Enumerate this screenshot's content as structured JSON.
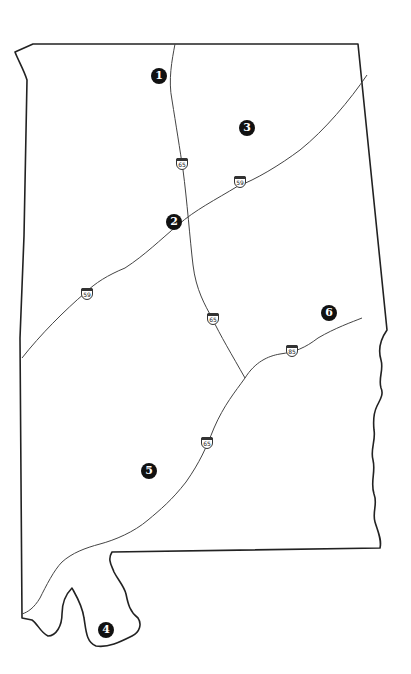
{
  "map": {
    "region": "Alabama",
    "colors": {
      "background": "#ffffff",
      "border": "#222222",
      "road": "#444444",
      "marker_fill": "#111111",
      "marker_text": "#ffffff"
    }
  },
  "markers": [
    {
      "id": "1",
      "label": "1",
      "x": 159,
      "y": 76
    },
    {
      "id": "2",
      "label": "2",
      "x": 174,
      "y": 222
    },
    {
      "id": "3",
      "label": "3",
      "x": 247,
      "y": 128
    },
    {
      "id": "4",
      "label": "4",
      "x": 106,
      "y": 630
    },
    {
      "id": "5",
      "label": "5",
      "x": 149,
      "y": 471
    },
    {
      "id": "6",
      "label": "6",
      "x": 329,
      "y": 313
    }
  ],
  "shields": [
    {
      "route": "65",
      "x": 182,
      "y": 164
    },
    {
      "route": "59",
      "x": 240,
      "y": 182
    },
    {
      "route": "59",
      "x": 87,
      "y": 294
    },
    {
      "route": "65",
      "x": 213,
      "y": 319
    },
    {
      "route": "85",
      "x": 292,
      "y": 351
    },
    {
      "route": "65",
      "x": 207,
      "y": 443
    }
  ]
}
